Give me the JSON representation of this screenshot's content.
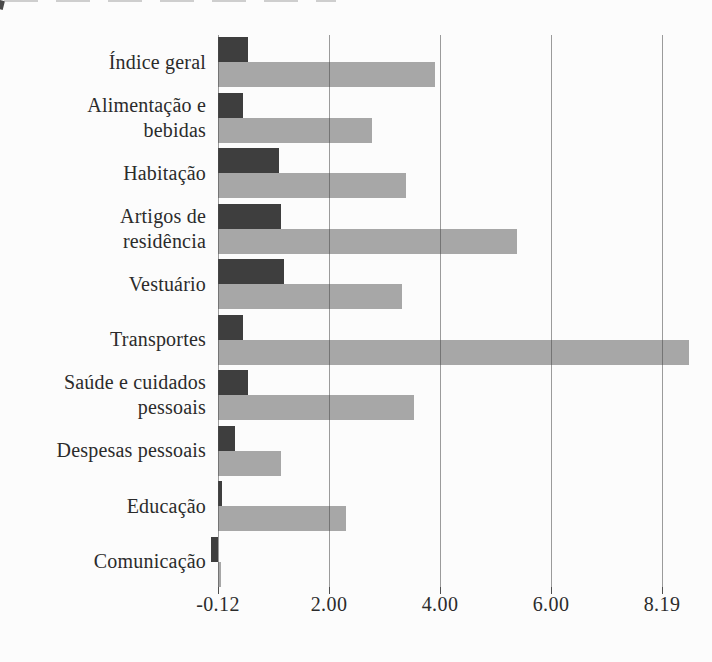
{
  "page": {
    "background_color": "#fcfcfc",
    "text_color": "#2b2b2b"
  },
  "chart_data": {
    "type": "bar",
    "orientation": "horizontal",
    "title": "",
    "xlabel": "",
    "ylabel": "",
    "categories": [
      "Índice geral",
      "Alimentação e\nbebidas",
      "Habitação",
      "Artigos de\nresidência",
      "Vestuário",
      "Transportes",
      "Saúde e cuidados\npessoais",
      "Despesas pessoais",
      "Educação",
      "Comunicação"
    ],
    "series": [
      {
        "name": "series-dark",
        "color": "#3e3e3e",
        "values": [
          0.55,
          0.45,
          1.12,
          1.16,
          1.21,
          0.45,
          0.55,
          0.31,
          0.07,
          -0.12
        ]
      },
      {
        "name": "series-light",
        "color": "#a7a7a7",
        "values": [
          3.98,
          2.83,
          3.45,
          5.49,
          3.38,
          8.65,
          3.6,
          1.16,
          2.35,
          0.06
        ]
      }
    ],
    "x_ticks": [
      "-0.12",
      "2.00",
      "4.00",
      "6.00",
      "8.19"
    ],
    "x_tick_values": [
      -0.12,
      2.0,
      4.0,
      6.0,
      8.19
    ],
    "xlim": [
      -0.12,
      8.8
    ],
    "grid": "vertical",
    "gridline_color": "#6e6e6e",
    "legend": "none"
  }
}
